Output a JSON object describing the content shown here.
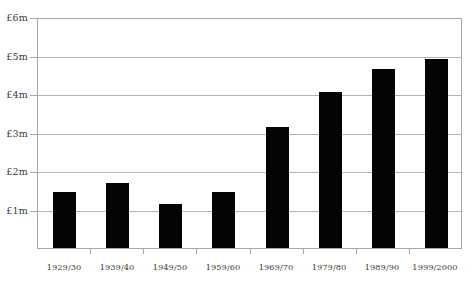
{
  "chart_data": {
    "type": "bar",
    "title": "",
    "subtitle": "",
    "xlabel": "",
    "ylabel": "",
    "categories": [
      "1929/30",
      "1939/40",
      "1949/50",
      "1959/60",
      "1969/70",
      "1979/80",
      "1989/90",
      "1999/2000"
    ],
    "values": [
      1.45,
      1.7,
      1.15,
      1.45,
      3.15,
      4.05,
      4.65,
      4.9
    ],
    "value_unit": "£m",
    "ylim": [
      0,
      6
    ],
    "ytick_values": [
      0,
      1,
      2,
      3,
      4,
      5,
      6
    ],
    "ytick_labels": [
      "",
      "£1m",
      "£2m",
      "£3m",
      "£4m",
      "£5m",
      "£6m"
    ],
    "grid": true,
    "grid_axis": "y",
    "legend": false,
    "legend_position": "none",
    "bar_color": "#040404",
    "grid_color": "#b2b2b2",
    "axis_color": "#a8a8a8",
    "background_color": "#ffffff",
    "annotations": []
  },
  "axes": {
    "y_labels": [
      {
        "text": "£6m",
        "value": 6
      },
      {
        "text": "£5m",
        "value": 5
      },
      {
        "text": "£4m",
        "value": 4
      },
      {
        "text": "£3m",
        "value": 3
      },
      {
        "text": "£2m",
        "value": 2
      },
      {
        "text": "£1m",
        "value": 1
      }
    ],
    "x_labels": [
      {
        "text": "1929/30"
      },
      {
        "text": "1939/40"
      },
      {
        "text": "1949/50"
      },
      {
        "text": "1959/60"
      },
      {
        "text": "1969/70"
      },
      {
        "text": "1979/80"
      },
      {
        "text": "1989/90"
      },
      {
        "text": "1999/2000"
      }
    ]
  }
}
